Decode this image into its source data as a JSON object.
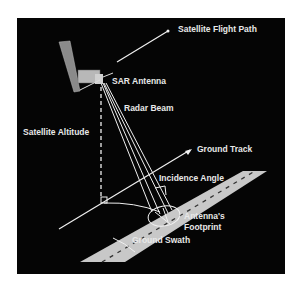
{
  "diagram": {
    "type": "SAR imaging geometry",
    "labels": {
      "flight_path": "Satellite Flight Path",
      "sar_antenna": "SAR Antenna",
      "radar_beam": "Radar Beam",
      "altitude": "Satellite Altitude",
      "ground_track": "Ground Track",
      "incidence_angle": "Incidence Angle",
      "footprint_line1": "Antenna's",
      "footprint_line2": "Footprint",
      "ground_swath": "Ground Swath"
    },
    "colors": {
      "background": "#050505",
      "lines": "#f0f0f0",
      "swath": "#c8c8c8",
      "solar_panel": "#8a8a8a",
      "text": "#e8e8e8"
    }
  }
}
